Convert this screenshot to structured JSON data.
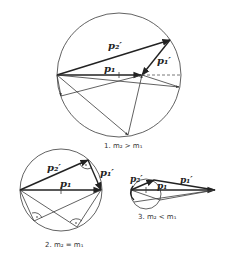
{
  "diagrams": [
    {
      "id": "case1",
      "caption": "1. m₂ > m₁",
      "labels": {
        "p2_prime": "p₂′",
        "p1": "p₁",
        "p1_prime": "p₁′"
      }
    },
    {
      "id": "case2",
      "caption": "2. m₂ = m₁",
      "labels": {
        "p2_prime": "p₂′",
        "p1": "p₁",
        "p1_prime": "p₁′"
      }
    },
    {
      "id": "case3",
      "caption": "3. m₂ < m₁",
      "labels": {
        "p2_prime": "p₂′",
        "p1": "p₁",
        "p1_prime": "p₁′"
      }
    }
  ],
  "colors": {
    "ink": "#222222",
    "background": "#ffffff"
  }
}
